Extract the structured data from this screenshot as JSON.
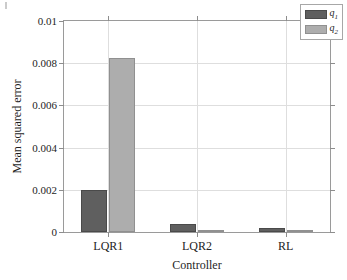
{
  "chart_data": {
    "type": "bar",
    "title": "",
    "subtitle": "",
    "xlabel": "Controller",
    "ylabel": "Mean squared error",
    "categories": [
      "LQR1",
      "LQR2",
      "RL"
    ],
    "series": [
      {
        "name": "q1",
        "label": "q",
        "subscript": "1",
        "color": "#5f5f5f",
        "values": [
          0.002,
          0.0004,
          0.0002
        ]
      },
      {
        "name": "q2",
        "label": "q",
        "subscript": "2",
        "color": "#adadad",
        "values": [
          0.00825,
          8e-05,
          5e-05
        ]
      }
    ],
    "ylim": [
      0,
      0.01
    ],
    "yticks": [
      0,
      0.002,
      0.004,
      0.006,
      0.008,
      0.01
    ],
    "ytick_labels": [
      "0",
      "0.002",
      "0.004",
      "0.006",
      "0.008",
      "0.01"
    ],
    "xtick_labels": [
      "LQR1",
      "LQR2",
      "RL"
    ],
    "grid": true,
    "grid_axis": "both",
    "legend_position": "top-right",
    "legend_entries": [
      "q1",
      "q2"
    ]
  }
}
